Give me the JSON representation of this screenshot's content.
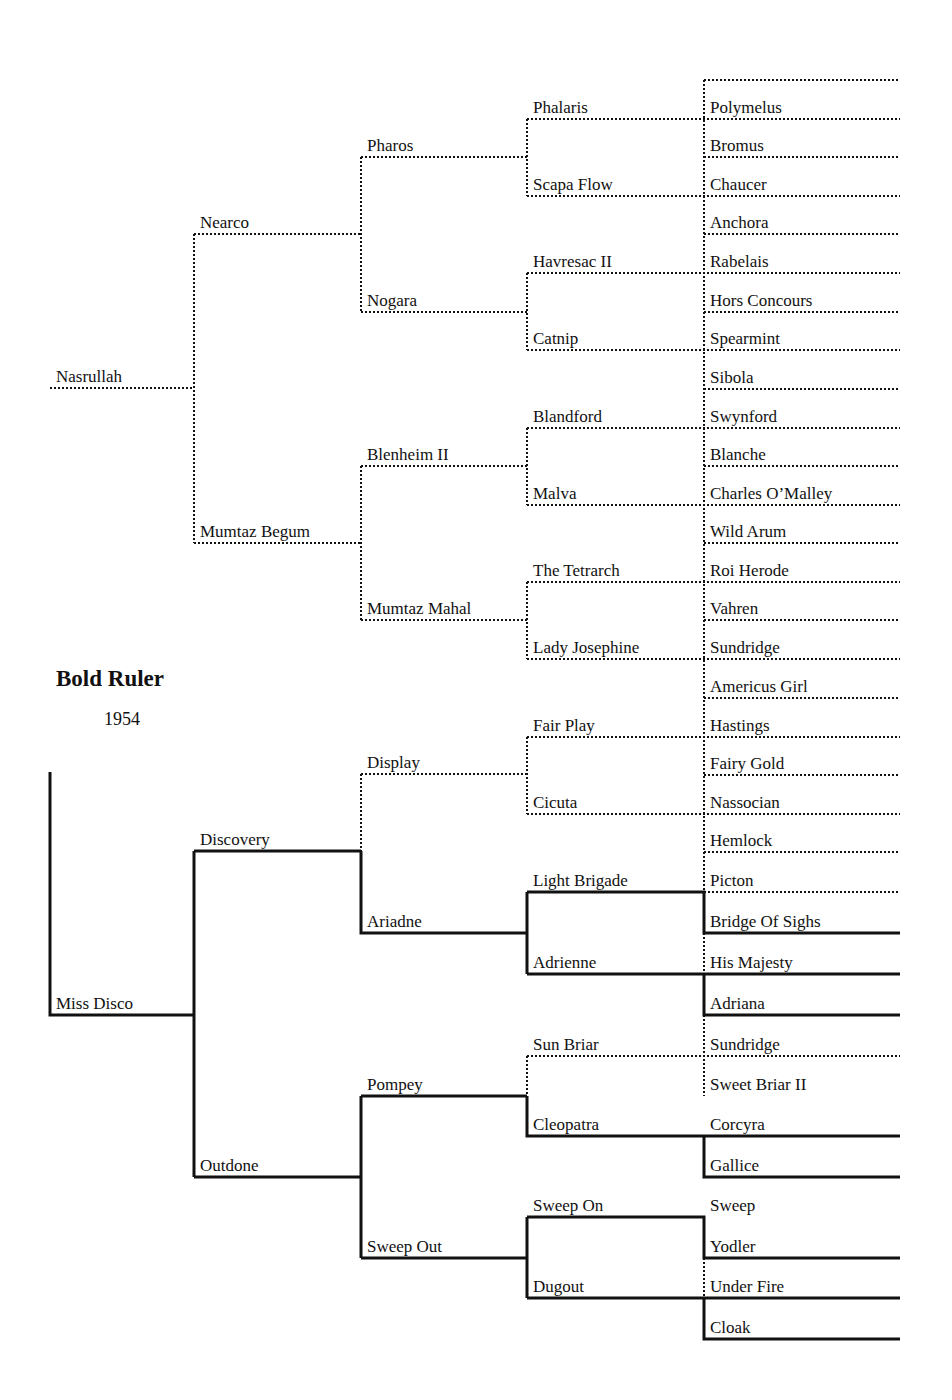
{
  "title": "Bold Ruler",
  "year": "1954",
  "colors": {
    "line": "#111111",
    "background": "#ffffff"
  },
  "pedigree": {
    "sire": {
      "name": "Nasrullah",
      "sire": {
        "name": "Nearco",
        "sire": {
          "name": "Pharos",
          "sire": {
            "name": "Phalaris",
            "sire": "Polymelus",
            "dam": "Bromus"
          },
          "dam": {
            "name": "Scapa Flow",
            "sire": "Chaucer",
            "dam": "Anchora"
          }
        },
        "dam": {
          "name": "Nogara",
          "sire": {
            "name": "Havresac II",
            "sire": "Rabelais",
            "dam": "Hors Concours"
          },
          "dam": {
            "name": "Catnip",
            "sire": "Spearmint",
            "dam": "Sibola"
          }
        }
      },
      "dam": {
        "name": "Mumtaz Begum",
        "sire": {
          "name": "Blenheim II",
          "sire": {
            "name": "Blandford",
            "sire": "Swynford",
            "dam": "Blanche"
          },
          "dam": {
            "name": "Malva",
            "sire": "Charles O'Malley",
            "dam": "Wild Arum"
          }
        },
        "dam": {
          "name": "Mumtaz Mahal",
          "sire": {
            "name": "The Tetrarch",
            "sire": "Roi Herode",
            "dam": "Vahren"
          },
          "dam": {
            "name": "Lady Josephine",
            "sire": "Sundridge",
            "dam": "Americus Girl"
          }
        }
      }
    },
    "dam": {
      "name": "Miss Disco",
      "sire": {
        "name": "Discovery",
        "sire": {
          "name": "Display",
          "sire": {
            "name": "Fair Play",
            "sire": "Hastings",
            "dam": "Fairy Gold"
          },
          "dam": {
            "name": "Cicuta",
            "sire": "Nassocian",
            "dam": "Hemlock"
          }
        },
        "dam": {
          "name": "Ariadne",
          "sire": {
            "name": "Light Brigade",
            "sire": "Picton",
            "dam": "Bridge Of Sighs"
          },
          "dam": {
            "name": "Adrienne",
            "sire": "His Majesty",
            "dam": "Adriana"
          }
        }
      },
      "dam": {
        "name": "Outdone",
        "sire": {
          "name": "Pompey",
          "sire": {
            "name": "Sun Briar",
            "sire": "Sundridge",
            "dam": "Sweet Briar II"
          },
          "dam": {
            "name": "Cleopatra",
            "sire": "Corcyra",
            "dam": "Gallice"
          }
        },
        "dam": {
          "name": "Sweep Out",
          "sire": {
            "name": "Sweep On",
            "sire": "Sweep",
            "dam": "Yodler"
          },
          "dam": {
            "name": "Dugout",
            "sire": "Under Fire",
            "dam": "Cloak"
          }
        }
      }
    }
  },
  "labels": [
    {
      "id": "nasrullah",
      "text": "Nasrullah",
      "x": 56,
      "y": 388
    },
    {
      "id": "nearco",
      "text": "Nearco",
      "x": 200,
      "y": 234
    },
    {
      "id": "mumtaz-begum",
      "text": "Mumtaz Begum",
      "x": 200,
      "y": 543
    },
    {
      "id": "pharos",
      "text": "Pharos",
      "x": 367,
      "y": 157
    },
    {
      "id": "nogara",
      "text": "Nogara",
      "x": 367,
      "y": 312
    },
    {
      "id": "blenheim-ii",
      "text": "Blenheim II",
      "x": 367,
      "y": 466
    },
    {
      "id": "mumtaz-mahal",
      "text": "Mumtaz Mahal",
      "x": 367,
      "y": 620
    },
    {
      "id": "phalaris",
      "text": "Phalaris",
      "x": 533,
      "y": 119
    },
    {
      "id": "scapa-flow",
      "text": "Scapa Flow",
      "x": 533,
      "y": 196
    },
    {
      "id": "havresac-ii",
      "text": "Havresac II",
      "x": 533,
      "y": 273
    },
    {
      "id": "catnip",
      "text": "Catnip",
      "x": 533,
      "y": 350
    },
    {
      "id": "blandford",
      "text": "Blandford",
      "x": 533,
      "y": 428
    },
    {
      "id": "malva",
      "text": "Malva",
      "x": 533,
      "y": 505
    },
    {
      "id": "the-tetrarch",
      "text": "The Tetrarch",
      "x": 533,
      "y": 582
    },
    {
      "id": "lady-josephine",
      "text": "Lady Josephine",
      "x": 533,
      "y": 659
    },
    {
      "id": "polymelus",
      "text": "Polymelus",
      "x": 710,
      "y": 119
    },
    {
      "id": "bromus",
      "text": "Bromus",
      "x": 710,
      "y": 157
    },
    {
      "id": "chaucer",
      "text": "Chaucer",
      "x": 710,
      "y": 196
    },
    {
      "id": "anchora",
      "text": "Anchora",
      "x": 710,
      "y": 234
    },
    {
      "id": "rabelais",
      "text": "Rabelais",
      "x": 710,
      "y": 273
    },
    {
      "id": "hors-concours",
      "text": "Hors Concours",
      "x": 710,
      "y": 312
    },
    {
      "id": "spearmint",
      "text": "Spearmint",
      "x": 710,
      "y": 350
    },
    {
      "id": "sibola",
      "text": "Sibola",
      "x": 710,
      "y": 389
    },
    {
      "id": "swynford",
      "text": "Swynford",
      "x": 710,
      "y": 428
    },
    {
      "id": "blanche",
      "text": "Blanche",
      "x": 710,
      "y": 466
    },
    {
      "id": "charles-omalley",
      "text": "Charles O’Malley",
      "x": 710,
      "y": 505
    },
    {
      "id": "wild-arum",
      "text": "Wild Arum",
      "x": 710,
      "y": 543
    },
    {
      "id": "roi-herode",
      "text": "Roi Herode",
      "x": 710,
      "y": 582
    },
    {
      "id": "vahren",
      "text": "Vahren",
      "x": 710,
      "y": 620
    },
    {
      "id": "sundridge-1",
      "text": "Sundridge",
      "x": 710,
      "y": 659
    },
    {
      "id": "americus-girl",
      "text": "Americus Girl",
      "x": 710,
      "y": 698
    },
    {
      "id": "miss-disco",
      "text": "Miss Disco",
      "x": 56,
      "y": 1015
    },
    {
      "id": "discovery",
      "text": "Discovery",
      "x": 200,
      "y": 851
    },
    {
      "id": "outdone",
      "text": "Outdone",
      "x": 200,
      "y": 1177
    },
    {
      "id": "display",
      "text": "Display",
      "x": 367,
      "y": 774
    },
    {
      "id": "ariadne",
      "text": "Ariadne",
      "x": 367,
      "y": 933
    },
    {
      "id": "pompey",
      "text": "Pompey",
      "x": 367,
      "y": 1096
    },
    {
      "id": "sweep-out",
      "text": "Sweep Out",
      "x": 367,
      "y": 1258
    },
    {
      "id": "fair-play",
      "text": "Fair Play",
      "x": 533,
      "y": 737
    },
    {
      "id": "cicuta",
      "text": "Cicuta",
      "x": 533,
      "y": 814
    },
    {
      "id": "light-brigade",
      "text": "Light Brigade",
      "x": 533,
      "y": 892
    },
    {
      "id": "adrienne",
      "text": "Adrienne",
      "x": 533,
      "y": 974
    },
    {
      "id": "sun-briar",
      "text": "Sun Briar",
      "x": 533,
      "y": 1056
    },
    {
      "id": "cleopatra",
      "text": "Cleopatra",
      "x": 533,
      "y": 1136
    },
    {
      "id": "sweep-on",
      "text": "Sweep On",
      "x": 533,
      "y": 1217
    },
    {
      "id": "dugout",
      "text": "Dugout",
      "x": 533,
      "y": 1298
    },
    {
      "id": "hastings",
      "text": "Hastings",
      "x": 710,
      "y": 737
    },
    {
      "id": "fairy-gold",
      "text": "Fairy Gold",
      "x": 710,
      "y": 775
    },
    {
      "id": "nassocian",
      "text": "Nassocian",
      "x": 710,
      "y": 814
    },
    {
      "id": "hemlock",
      "text": "Hemlock",
      "x": 710,
      "y": 852
    },
    {
      "id": "picton",
      "text": "Picton",
      "x": 710,
      "y": 892
    },
    {
      "id": "bridge-of-sighs",
      "text": "Bridge Of Sighs",
      "x": 710,
      "y": 933
    },
    {
      "id": "his-majesty",
      "text": "His Majesty",
      "x": 710,
      "y": 974
    },
    {
      "id": "adriana",
      "text": "Adriana",
      "x": 710,
      "y": 1015
    },
    {
      "id": "sundridge-2",
      "text": "Sundridge",
      "x": 710,
      "y": 1056
    },
    {
      "id": "sweet-briar-ii",
      "text": "Sweet Briar II",
      "x": 710,
      "y": 1096
    },
    {
      "id": "corcyra",
      "text": "Corcyra",
      "x": 710,
      "y": 1136
    },
    {
      "id": "gallice",
      "text": "Gallice",
      "x": 710,
      "y": 1177
    },
    {
      "id": "sweep",
      "text": "Sweep",
      "x": 710,
      "y": 1217
    },
    {
      "id": "yodler",
      "text": "Yodler",
      "x": 710,
      "y": 1258
    },
    {
      "id": "under-fire",
      "text": "Under Fire",
      "x": 710,
      "y": 1298
    },
    {
      "id": "cloak",
      "text": "Cloak",
      "x": 710,
      "y": 1339
    }
  ],
  "lines": [
    {
      "d": "M704 80 H900",
      "s": "dot"
    },
    {
      "d": "M50 388 H194",
      "s": "dot"
    },
    {
      "d": "M194 234 V543",
      "s": "dot"
    },
    {
      "d": "M194 234 H361",
      "s": "dot"
    },
    {
      "d": "M194 543 H361",
      "s": "dot"
    },
    {
      "d": "M361 157 V312",
      "s": "dot"
    },
    {
      "d": "M361 157 H527",
      "s": "dot"
    },
    {
      "d": "M361 312 H527",
      "s": "dot"
    },
    {
      "d": "M361 466 V620",
      "s": "dot"
    },
    {
      "d": "M361 466 H527",
      "s": "dot"
    },
    {
      "d": "M361 620 H527",
      "s": "dot"
    },
    {
      "d": "M527 119 V196",
      "s": "dot"
    },
    {
      "d": "M527 273 V350",
      "s": "dot"
    },
    {
      "d": "M527 428 V505",
      "s": "dot"
    },
    {
      "d": "M527 582 V659",
      "s": "dot"
    },
    {
      "d": "M527 737 V814",
      "s": "dot"
    },
    {
      "d": "M527 1056 V1096",
      "s": "dot"
    },
    {
      "d": "M704 80 V892",
      "s": "dot"
    },
    {
      "d": "M704 933 V974",
      "s": "dot"
    },
    {
      "d": "M704 1015 V1096",
      "s": "dot"
    },
    {
      "d": "M704 1258 V1298",
      "s": "dot"
    },
    {
      "d": "M527 119 H900",
      "s": "dot"
    },
    {
      "d": "M704 157 H900",
      "s": "dot"
    },
    {
      "d": "M527 196 H900",
      "s": "dot"
    },
    {
      "d": "M704 234 H900",
      "s": "dot"
    },
    {
      "d": "M527 273 H900",
      "s": "dot"
    },
    {
      "d": "M704 312 H900",
      "s": "dot"
    },
    {
      "d": "M527 350 H900",
      "s": "dot"
    },
    {
      "d": "M704 389 H900",
      "s": "dot"
    },
    {
      "d": "M527 428 H900",
      "s": "dot"
    },
    {
      "d": "M704 466 H900",
      "s": "dot"
    },
    {
      "d": "M527 505 H900",
      "s": "dot"
    },
    {
      "d": "M704 543 H900",
      "s": "dot"
    },
    {
      "d": "M527 582 H900",
      "s": "dot"
    },
    {
      "d": "M704 620 H900",
      "s": "dot"
    },
    {
      "d": "M527 659 H900",
      "s": "dot"
    },
    {
      "d": "M704 698 H900",
      "s": "dot"
    },
    {
      "d": "M527 737 H900",
      "s": "dot"
    },
    {
      "d": "M704 775 H900",
      "s": "dot"
    },
    {
      "d": "M527 814 H900",
      "s": "dot"
    },
    {
      "d": "M704 852 H900",
      "s": "dot"
    },
    {
      "d": "M704 892 H900",
      "s": "dot"
    },
    {
      "d": "M361 774 H527",
      "s": "dot"
    },
    {
      "d": "M361 774 V851",
      "s": "dot"
    },
    {
      "d": "M527 1056 H900",
      "s": "dot"
    },
    {
      "d": "M50 772 V1015 H194",
      "s": "solid"
    },
    {
      "d": "M194 851 V1177",
      "s": "solid"
    },
    {
      "d": "M194 851 H361",
      "s": "solid"
    },
    {
      "d": "M194 1177 H361",
      "s": "solid"
    },
    {
      "d": "M361 851 V933 H527",
      "s": "solid"
    },
    {
      "d": "M527 892 V974",
      "s": "solid"
    },
    {
      "d": "M527 892 H704 V933 H900",
      "s": "solid"
    },
    {
      "d": "M527 974 H900",
      "s": "solid"
    },
    {
      "d": "M704 974 V1015 H900",
      "s": "solid"
    },
    {
      "d": "M361 1096 V1258",
      "s": "solid"
    },
    {
      "d": "M361 1096 H527",
      "s": "solid"
    },
    {
      "d": "M361 1258 H527",
      "s": "solid"
    },
    {
      "d": "M527 1096 V1136 H900",
      "s": "solid"
    },
    {
      "d": "M704 1136 V1177 H900",
      "s": "solid"
    },
    {
      "d": "M527 1217 V1298",
      "s": "solid"
    },
    {
      "d": "M527 1217 H704 V1258 H900",
      "s": "solid"
    },
    {
      "d": "M527 1298 H900",
      "s": "solid"
    },
    {
      "d": "M704 1298 V1339 H900",
      "s": "solid"
    }
  ]
}
